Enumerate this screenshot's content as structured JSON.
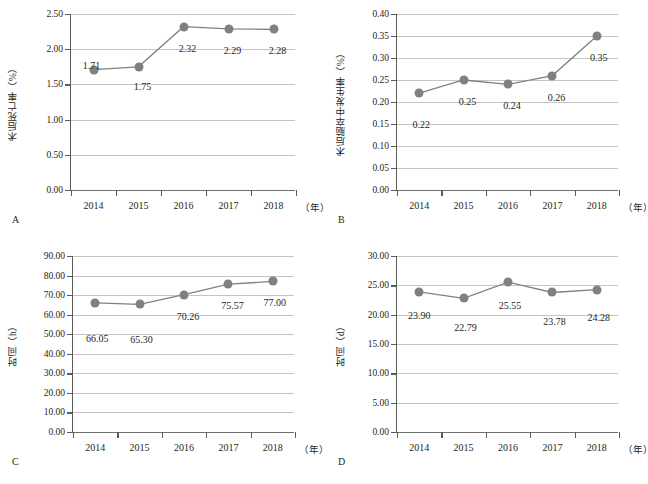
{
  "figure": {
    "panel_letters": [
      "A",
      "B",
      "C",
      "D"
    ],
    "x_unit_label": "（年）",
    "marker_color": "#808080",
    "line_color": "#808080",
    "gridline_color": "#c4c4c4",
    "axis_color": "#5b5b5b",
    "text_color": "#231f20"
  },
  "chart_data": [
    {
      "type": "line",
      "panel": "A",
      "title": "",
      "xlabel": "（年）",
      "ylabel": "术后死亡率（%）",
      "categories": [
        "2014",
        "2015",
        "2016",
        "2017",
        "2018"
      ],
      "values": [
        1.71,
        1.75,
        2.32,
        2.29,
        2.28
      ],
      "data_labels": [
        "1.71",
        "1.75",
        "2.32",
        "2.29",
        "2.28"
      ],
      "ylim": [
        0.0,
        2.5
      ],
      "yticks": [
        0.0,
        0.5,
        1.0,
        1.5,
        2.0,
        2.5
      ],
      "ytick_labels": [
        "0.00",
        "0.50",
        "1.00",
        "1.50",
        "2.00",
        "2.50"
      ],
      "grid": true,
      "legend": "none"
    },
    {
      "type": "line",
      "panel": "B",
      "title": "",
      "xlabel": "（年）",
      "ylabel": "术后脑卒中发生率（%）",
      "categories": [
        "2014",
        "2015",
        "2016",
        "2017",
        "2018"
      ],
      "values": [
        0.22,
        0.25,
        0.24,
        0.26,
        0.35
      ],
      "data_labels": [
        "0.22",
        "0.25",
        "0.24",
        "0.26",
        "0.35"
      ],
      "ylim": [
        0.0,
        0.4
      ],
      "yticks": [
        0.0,
        0.05,
        0.1,
        0.15,
        0.2,
        0.25,
        0.3,
        0.35,
        0.4
      ],
      "ytick_labels": [
        "0.00",
        "0.05",
        "0.10",
        "0.15",
        "0.20",
        "0.25",
        "0.30",
        "0.35",
        "0.40"
      ],
      "grid": true,
      "legend": "none"
    },
    {
      "type": "line",
      "panel": "C",
      "title": "",
      "xlabel": "（年）",
      "ylabel": "时间（h）",
      "categories": [
        "2014",
        "2015",
        "2016",
        "2017",
        "2018"
      ],
      "values": [
        66.05,
        65.3,
        70.26,
        75.57,
        77.0
      ],
      "data_labels": [
        "66.05",
        "65.30",
        "70.26",
        "75.57",
        "77.00"
      ],
      "ylim": [
        0.0,
        90.0
      ],
      "yticks": [
        0.0,
        10.0,
        20.0,
        30.0,
        40.0,
        50.0,
        60.0,
        70.0,
        80.0,
        90.0
      ],
      "ytick_labels": [
        "0.00",
        "10.00",
        "20.00",
        "30.00",
        "40.00",
        "50.00",
        "60.00",
        "70.00",
        "80.00",
        "90.00"
      ],
      "grid": true,
      "legend": "none"
    },
    {
      "type": "line",
      "panel": "D",
      "title": "",
      "xlabel": "（年）",
      "ylabel": "时间（d）",
      "categories": [
        "2014",
        "2015",
        "2016",
        "2017",
        "2018"
      ],
      "values": [
        23.9,
        22.79,
        25.55,
        23.78,
        24.28
      ],
      "data_labels": [
        "23.90",
        "22.79",
        "25.55",
        "23.78",
        "24.28"
      ],
      "ylim": [
        0.0,
        30.0
      ],
      "yticks": [
        0.0,
        5.0,
        10.0,
        15.0,
        20.0,
        25.0,
        30.0
      ],
      "ytick_labels": [
        "0.00",
        "5.00",
        "10.00",
        "15.00",
        "20.00",
        "25.00",
        "30.00"
      ],
      "grid": true,
      "legend": "none"
    }
  ]
}
